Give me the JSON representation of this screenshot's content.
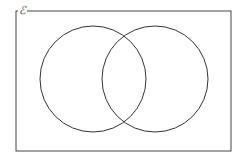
{
  "diagram": {
    "type": "venn",
    "universal_set_label": "ℰ",
    "rectangle": {
      "x": 16,
      "y": 11,
      "width": 215,
      "height": 140
    },
    "sets": [
      {
        "name": "set-a",
        "cx": 93,
        "cy": 79,
        "r": 53
      },
      {
        "name": "set-b",
        "cx": 155,
        "cy": 79,
        "r": 53
      }
    ],
    "colors": {
      "stroke": "#333333",
      "background": "#ffffff"
    }
  }
}
